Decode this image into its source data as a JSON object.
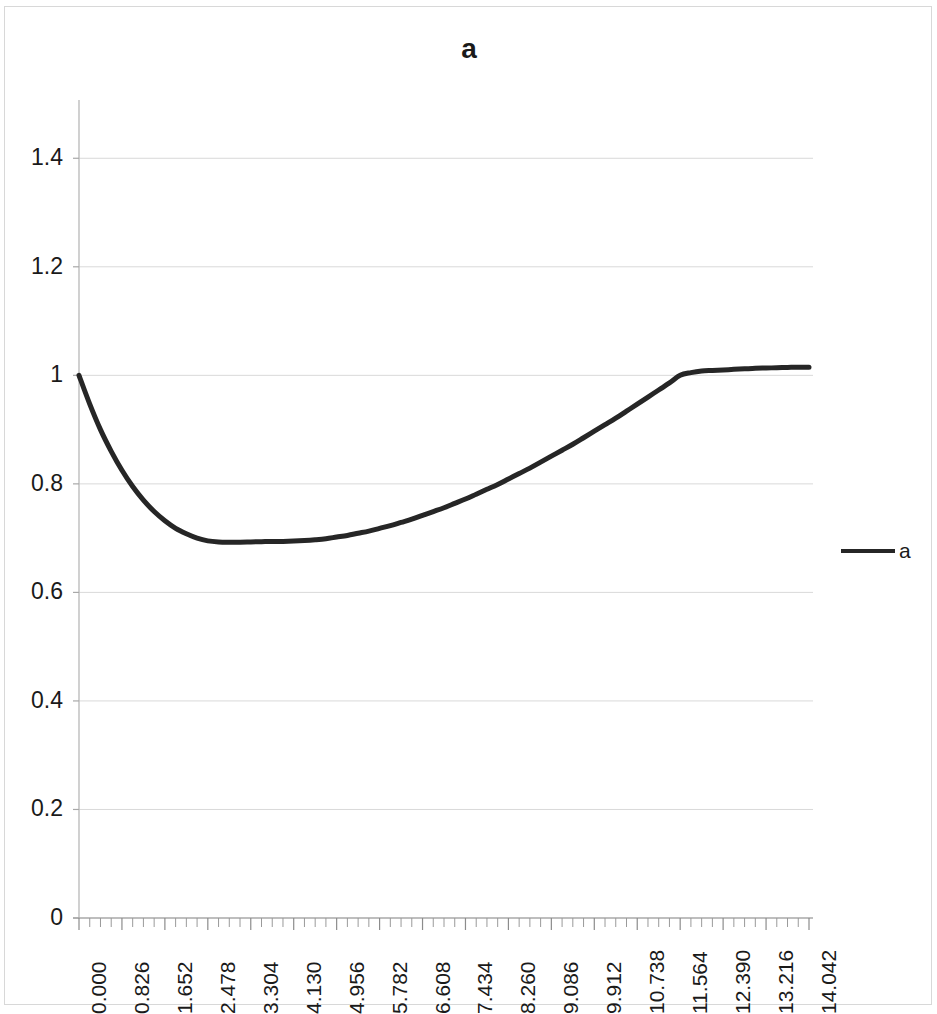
{
  "chart_data": {
    "type": "line",
    "title": "a",
    "xlabel": "",
    "ylabel": "",
    "grid": true,
    "legend_position": "right",
    "legend": [
      "a"
    ],
    "series_color": "#262626",
    "xlim": [
      0.0,
      14.042
    ],
    "ylim": [
      0,
      1.5
    ],
    "y_ticks": [
      "0",
      "0.2",
      "0.4",
      "0.6",
      "0.8",
      "1",
      "1.2",
      "1.4"
    ],
    "y_tick_values": [
      0,
      0.2,
      0.4,
      0.6,
      0.8,
      1.0,
      1.2,
      1.4
    ],
    "x_ticks": [
      "0.000",
      "0.826",
      "1.652",
      "2.478",
      "3.304",
      "4.130",
      "4.956",
      "5.782",
      "6.608",
      "7.434",
      "8.260",
      "9.086",
      "9.912",
      "10.738",
      "11.564",
      "12.390",
      "13.216",
      "14.042"
    ],
    "x_tick_values": [
      0.0,
      0.826,
      1.652,
      2.478,
      3.304,
      4.13,
      4.956,
      5.782,
      6.608,
      7.434,
      8.26,
      9.086,
      9.912,
      10.738,
      11.564,
      12.39,
      13.216,
      14.042
    ],
    "x_minor_ticks_per_major": 4,
    "series": [
      {
        "name": "a",
        "x": [
          0.0,
          0.207,
          0.413,
          0.62,
          0.826,
          1.033,
          1.239,
          1.446,
          1.652,
          1.859,
          2.065,
          2.272,
          2.478,
          2.685,
          2.891,
          3.098,
          3.304,
          3.511,
          3.717,
          3.924,
          4.13,
          4.337,
          4.543,
          4.75,
          4.956,
          5.163,
          5.369,
          5.576,
          5.782,
          5.989,
          6.195,
          6.402,
          6.608,
          6.815,
          7.021,
          7.228,
          7.434,
          7.641,
          7.847,
          8.054,
          8.26,
          8.467,
          8.673,
          8.88,
          9.086,
          9.293,
          9.499,
          9.706,
          9.912,
          10.119,
          10.325,
          10.532,
          10.738,
          10.945,
          11.151,
          11.358,
          11.564,
          11.771,
          11.977,
          12.184,
          12.39,
          12.597,
          12.803,
          13.01,
          13.216,
          13.423,
          13.629,
          13.836,
          14.042
        ],
        "y": [
          1.0,
          0.947,
          0.9,
          0.86,
          0.825,
          0.795,
          0.77,
          0.749,
          0.732,
          0.718,
          0.708,
          0.7,
          0.695,
          0.693,
          0.6925,
          0.6925,
          0.693,
          0.6935,
          0.694,
          0.694,
          0.6945,
          0.6955,
          0.697,
          0.699,
          0.702,
          0.705,
          0.709,
          0.713,
          0.718,
          0.723,
          0.729,
          0.735,
          0.742,
          0.749,
          0.756,
          0.764,
          0.772,
          0.781,
          0.79,
          0.799,
          0.809,
          0.819,
          0.829,
          0.84,
          0.851,
          0.862,
          0.873,
          0.885,
          0.897,
          0.909,
          0.921,
          0.934,
          0.947,
          0.96,
          0.973,
          0.986,
          1.0,
          1.005,
          1.008,
          1.009,
          1.01,
          1.011,
          1.012,
          1.013,
          1.0135,
          1.014,
          1.0145,
          1.015,
          1.015
        ]
      }
    ],
    "notable_values": {
      "start_y": 1.0,
      "minimum_y": 0.6925,
      "minimum_x": 4.5,
      "end_y": 1.015
    }
  },
  "legend": {
    "label": "a",
    "swatch_color": "#262626"
  },
  "title": {
    "text": "a"
  }
}
